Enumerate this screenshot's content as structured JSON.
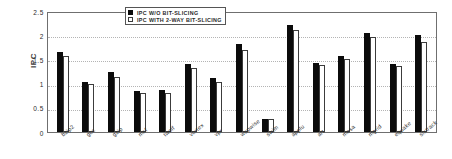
{
  "chart_data": {
    "type": "bar",
    "title": "",
    "xlabel": "",
    "ylabel": "IPC",
    "ylim": [
      0,
      2.5
    ],
    "yticks": [
      "2.5",
      "2",
      "1.5",
      "1",
      "0.5",
      "0"
    ],
    "grid": true,
    "legend_position": "top-center",
    "categories": [
      "bzip2",
      "gcc",
      "gzip",
      "mcf",
      "twolf",
      "vortex",
      "vpr",
      "wupwise",
      "swim",
      "applu",
      "art",
      "mesa",
      "mgrid",
      "equake",
      "sixtrack"
    ],
    "series": [
      {
        "name": "IPC W/O BIT-SLICING",
        "color": "#0b0b0b",
        "values": [
          1.66,
          1.03,
          1.24,
          0.84,
          0.86,
          1.4,
          1.11,
          1.82,
          0.27,
          2.22,
          1.42,
          1.57,
          2.05,
          1.4,
          2.0
        ]
      },
      {
        "name": "IPC WITH 2-WAY BIT-SLICING",
        "color": "#ffffff",
        "values": [
          1.57,
          0.99,
          1.13,
          0.81,
          0.8,
          1.32,
          1.04,
          1.7,
          0.26,
          2.1,
          1.39,
          1.51,
          1.96,
          1.36,
          1.86
        ]
      }
    ]
  },
  "legend": {
    "items": [
      {
        "label": "IPC W/O BIT-SLICING",
        "swatch": "filled-square-icon"
      },
      {
        "label": "IPC WITH 2-WAY BIT-SLICING",
        "swatch": "open-square-icon"
      }
    ]
  },
  "axis": {
    "y_title": "IPC"
  }
}
